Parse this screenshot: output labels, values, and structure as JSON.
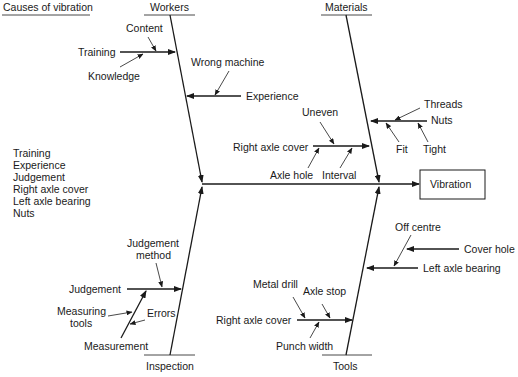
{
  "title": "Causes of vibration",
  "effect": "Vibration",
  "categories": {
    "workers": "Workers",
    "materials": "Materials",
    "inspection": "Inspection",
    "tools": "Tools"
  },
  "workers": {
    "training": "Training",
    "content": "Content",
    "knowledge": "Knowledge",
    "wrong_machine": "Wrong machine",
    "experience": "Experience"
  },
  "materials": {
    "threads": "Threads",
    "nuts": "Nuts",
    "fit": "Fit",
    "tight": "Tight",
    "uneven": "Uneven",
    "right_axle_cover": "Right axle cover",
    "axle_hole": "Axle hole",
    "interval": "Interval"
  },
  "inspection": {
    "judgement_method_1": "Judgement",
    "judgement_method_2": "method",
    "judgement": "Judgement",
    "measuring_tools_1": "Measuring",
    "measuring_tools_2": "tools",
    "errors": "Errors",
    "measurement": "Measurement"
  },
  "tools": {
    "off_centre": "Off centre",
    "cover_hole": "Cover hole",
    "left_axle_bearing": "Left axle bearing",
    "metal_drill": "Metal drill",
    "axle_stop": "Axle stop",
    "right_axle_cover": "Right axle cover",
    "punch_width": "Punch width"
  },
  "key_causes": [
    "Training",
    "Experience",
    "Judgement",
    "Right axle  cover",
    "Left axle  bearing",
    "Nuts"
  ]
}
